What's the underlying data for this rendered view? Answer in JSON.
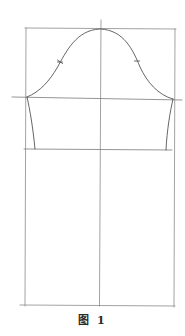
{
  "figure": {
    "caption": "图 1"
  },
  "colors": {
    "line": "#7a7a7a",
    "curve": "#555555",
    "background": "#ffffff",
    "caption": "#2a2a2a"
  },
  "geometry": {
    "top_line_y": 28,
    "cap_line_y": 97,
    "elbow_line_y": 149,
    "bottom_line_y": 305,
    "left_x": 26,
    "center_x": 100,
    "right_x": 175,
    "notches": [
      {
        "name": "front-notch",
        "x": 60,
        "y": 62
      },
      {
        "name": "back-notch",
        "x": 137,
        "y": 61
      }
    ]
  }
}
